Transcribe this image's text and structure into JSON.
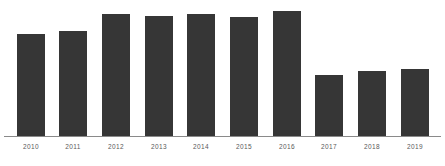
{
  "chart_data": {
    "type": "bar",
    "title": "",
    "subtitle": "",
    "xlabel": "",
    "ylabel": "",
    "grid": false,
    "legend": null,
    "ylim": [
      0,
      100
    ],
    "categories": [
      "2010",
      "2011",
      "2012",
      "2013",
      "2014",
      "2015",
      "2016",
      "2017",
      "2018",
      "2019"
    ],
    "values": [
      82,
      84,
      98,
      96,
      98,
      95,
      100,
      49,
      52,
      54
    ],
    "series": [
      {
        "name": "",
        "values": [
          82,
          84,
          98,
          96,
          98,
          95,
          100,
          49,
          52,
          54
        ]
      }
    ],
    "bar_color": "#363636",
    "axis_color": "#8a8a8a",
    "label_color": "#5a5a5a",
    "background_color": "#ffffff"
  },
  "layout": {
    "bar_width_px": 28,
    "bar_pitch_px": 42.6,
    "first_bar_left_px": 17,
    "baseline_y_px": 136,
    "max_bar_height_px": 126
  },
  "ticks": [
    {
      "label": "2010",
      "center_x": 31
    },
    {
      "label": "2011",
      "center_x": 73
    },
    {
      "label": "2012",
      "center_x": 116
    },
    {
      "label": "2013",
      "center_x": 159
    },
    {
      "label": "2014",
      "center_x": 201
    },
    {
      "label": "2015",
      "center_x": 244
    },
    {
      "label": "2016",
      "center_x": 287
    },
    {
      "label": "2017",
      "center_x": 329
    },
    {
      "label": "2018",
      "center_x": 372
    },
    {
      "label": "2019",
      "center_x": 415
    }
  ],
  "bars": [
    {
      "category": "2010",
      "value": 82,
      "left_px": 17,
      "height_px": 103
    },
    {
      "category": "2011",
      "value": 84,
      "left_px": 59,
      "height_px": 106
    },
    {
      "category": "2012",
      "value": 98,
      "left_px": 102,
      "height_px": 123
    },
    {
      "category": "2013",
      "value": 96,
      "left_px": 145,
      "height_px": 121
    },
    {
      "category": "2014",
      "value": 98,
      "left_px": 187,
      "height_px": 123
    },
    {
      "category": "2015",
      "value": 95,
      "left_px": 230,
      "height_px": 120
    },
    {
      "category": "2016",
      "value": 100,
      "left_px": 273,
      "height_px": 126
    },
    {
      "category": "2017",
      "value": 49,
      "left_px": 315,
      "height_px": 62
    },
    {
      "category": "2018",
      "value": 52,
      "left_px": 358,
      "height_px": 66
    },
    {
      "category": "2019",
      "value": 54,
      "left_px": 401,
      "height_px": 68
    }
  ]
}
